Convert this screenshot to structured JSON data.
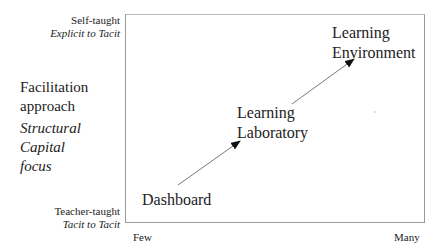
{
  "y_axis": {
    "top_label": "Self-taught",
    "top_sublabel": "Explicit to Tacit",
    "bottom_label": "Teacher-taught",
    "bottom_sublabel": "Tacit to Tacit",
    "title_line1": "Facilitation",
    "title_line2": "approach",
    "subtitle_line1": "Structural",
    "subtitle_line2": "Capital",
    "subtitle_line3": "focus"
  },
  "x_axis": {
    "left_label": "Few",
    "right_label": "Many"
  },
  "nodes": [
    {
      "line1": "Dashboard",
      "line2": ""
    },
    {
      "line1": "Learning",
      "line2": "Laboratory"
    },
    {
      "line1": "Learning",
      "line2": "Environment"
    }
  ],
  "colors": {
    "line": "#555555",
    "border": "#9a9a9a",
    "text": "#222222"
  }
}
